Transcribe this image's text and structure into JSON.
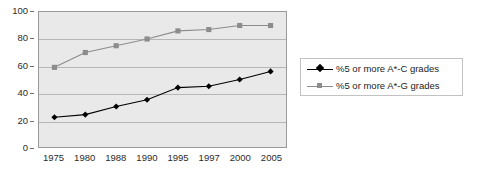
{
  "chart_data": {
    "type": "line",
    "title": "",
    "subtitle": "",
    "xlabel": "",
    "ylabel": "",
    "categories": [
      "1975",
      "1980",
      "1988",
      "1990",
      "1995",
      "1997",
      "2000",
      "2005"
    ],
    "series": [
      {
        "name": "%5 or more A*-C grades",
        "color": "#000000",
        "marker": "diamond",
        "values": [
          22,
          24,
          30,
          35,
          44,
          45,
          50,
          56
        ]
      },
      {
        "name": "%5 or more A*-G grades",
        "color": "#8c8c8c",
        "marker": "square",
        "values": [
          59,
          70,
          75,
          80,
          86,
          87,
          90,
          90
        ]
      }
    ],
    "ylim": [
      0,
      100
    ],
    "y_ticks": [
      "0",
      "20",
      "40",
      "60",
      "80",
      "100"
    ],
    "grid": true,
    "legend_position": "right",
    "plot_background": "#e9e9e9",
    "gridline_color": "#b6b6b6",
    "frame_color": "#9a9a9a"
  },
  "legend": {
    "entries": [
      {
        "label": "%5 or more A*-C grades"
      },
      {
        "label": "%5 or more A*-G grades"
      }
    ]
  }
}
